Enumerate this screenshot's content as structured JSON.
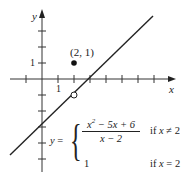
{
  "figure": {
    "axes": {
      "x_label": "x",
      "y_label": "y",
      "x_tick_label": "1",
      "y_tick_label": "1"
    },
    "point": {
      "label": "(2, 1)",
      "x": 2,
      "y": 1,
      "style": "filled"
    },
    "hole": {
      "x": 2,
      "y": -1,
      "style": "open"
    },
    "line": {
      "equation": "y = x - 3"
    },
    "equation": {
      "lhs": "y =",
      "case1_numerator": "x² − 5x + 6",
      "case1_denominator": "x − 2",
      "case1_condition": "if x ≠ 2",
      "case2_value": "1",
      "case2_condition": "if x = 2"
    },
    "colors": {
      "ink": "#222222",
      "background": "#ffffff"
    }
  }
}
